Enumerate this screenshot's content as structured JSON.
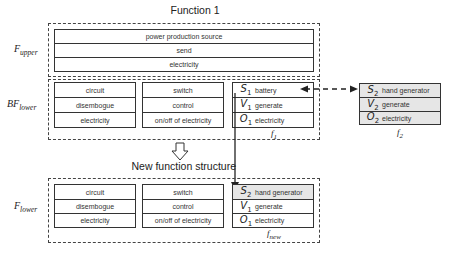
{
  "title": "Function 1",
  "subtitle": "New function structure",
  "labels": {
    "upper": {
      "main": "F",
      "sub": "upper"
    },
    "bf_lower": {
      "main": "BF",
      "sub": "lower"
    },
    "lower": {
      "main": "F",
      "sub": "lower"
    }
  },
  "upper_rows": [
    "power production source",
    "send",
    "electricity"
  ],
  "bf_lower": {
    "col1": [
      "circuit",
      "disembogue",
      "electricity"
    ],
    "col2": [
      "switch",
      "control",
      "on/off of electricity"
    ],
    "f1": {
      "caption": {
        "main": "f",
        "sub": "1"
      },
      "rows": [
        {
          "sym": "S",
          "sub": "1",
          "text": "battery"
        },
        {
          "sym": "V",
          "sub": "1",
          "text": "generate"
        },
        {
          "sym": "O",
          "sub": "1",
          "text": "electricity"
        }
      ]
    }
  },
  "f2": {
    "caption": {
      "main": "f",
      "sub": "2"
    },
    "rows": [
      {
        "sym": "S",
        "sub": "2",
        "text": "hand generator"
      },
      {
        "sym": "V",
        "sub": "2",
        "text": "generate"
      },
      {
        "sym": "O",
        "sub": "2",
        "text": "electricity"
      }
    ]
  },
  "lower": {
    "col1": [
      "circuit",
      "disembogue",
      "electricity"
    ],
    "col2": [
      "switch",
      "control",
      "on/off of electricity"
    ],
    "fnew": {
      "caption": {
        "main": "f",
        "sub": "new"
      },
      "rows": [
        {
          "sym": "S",
          "sub": "2",
          "text": "hand generator"
        },
        {
          "sym": "V",
          "sub": "1",
          "text": "generate"
        },
        {
          "sym": "O",
          "sub": "1",
          "text": "electricity"
        }
      ]
    }
  }
}
